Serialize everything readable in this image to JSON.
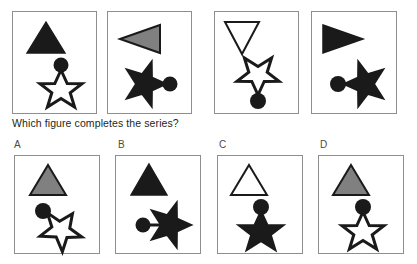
{
  "question": {
    "text": "Which figure completes the series?"
  },
  "colors": {
    "black": "#1a1a1a",
    "gray": "#808080",
    "white": "#ffffff",
    "outline": "#1a1a1a",
    "panel_border": "#8e8e8e",
    "background": "#ffffff",
    "text": "#231f20"
  },
  "series": {
    "name": "sequence-row",
    "panels": [
      {
        "index": 1,
        "triangle": {
          "fill": "black",
          "direction": "up"
        },
        "star": {
          "fill": "white",
          "rotation": 0
        },
        "circle": {
          "fill": "black",
          "position": "top"
        }
      },
      {
        "index": 2,
        "triangle": {
          "fill": "gray",
          "direction": "left"
        },
        "star": {
          "fill": "black",
          "rotation": 90
        },
        "circle": {
          "fill": "black",
          "position": "right"
        }
      },
      {
        "index": 3,
        "triangle": {
          "fill": "white",
          "direction": "down"
        },
        "star": {
          "fill": "white",
          "rotation": 180
        },
        "circle": {
          "fill": "black",
          "position": "bottom"
        }
      },
      {
        "index": 4,
        "triangle": {
          "fill": "black",
          "direction": "right"
        },
        "star": {
          "fill": "black",
          "rotation": 270
        },
        "circle": {
          "fill": "black",
          "position": "left"
        }
      }
    ]
  },
  "options": {
    "name": "answer-options-row",
    "items": [
      {
        "label": "A",
        "triangle": {
          "fill": "gray",
          "direction": "up"
        },
        "star": {
          "fill": "white",
          "rotation": 35
        },
        "circle": {
          "fill": "black",
          "position": "top-left"
        }
      },
      {
        "label": "B",
        "triangle": {
          "fill": "black",
          "direction": "up"
        },
        "star": {
          "fill": "black",
          "rotation": 90
        },
        "circle": {
          "fill": "black",
          "position": "left"
        }
      },
      {
        "label": "C",
        "triangle": {
          "fill": "white",
          "direction": "up"
        },
        "star": {
          "fill": "black",
          "rotation": 0
        },
        "circle": {
          "fill": "black",
          "position": "top"
        }
      },
      {
        "label": "D",
        "triangle": {
          "fill": "gray",
          "direction": "up"
        },
        "star": {
          "fill": "white",
          "rotation": 0
        },
        "circle": {
          "fill": "black",
          "position": "top"
        }
      }
    ]
  }
}
